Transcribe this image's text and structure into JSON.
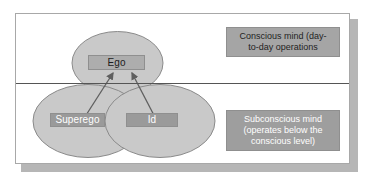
{
  "diagram": {
    "colors": {
      "card_background": "#ffffff",
      "card_border": "#a8a8a8",
      "card_shadow": "#b6b6b6",
      "ellipse_fill": "#c9c9c9",
      "ellipse_stroke": "#8a8a8a",
      "divider_line": "#555555",
      "chip_ego_fill": "#adadad",
      "chip_ego_text": "#1c1c1c",
      "chip_dark_fill": "#9a9a9a",
      "chip_dark_text": "#ffffff",
      "note_conscious_fill": "#a5a5a5",
      "note_conscious_text": "#1f1f1f",
      "note_subconscious_fill": "#9e9e9e",
      "note_subconscious_text": "#ffffff",
      "arrow_color": "#5f5f5f"
    },
    "ellipses": [
      {
        "name": "ego-ellipse",
        "label": "Ego"
      },
      {
        "name": "superego-ellipse",
        "label": "Superego"
      },
      {
        "name": "id-ellipse",
        "label": "Id"
      }
    ],
    "chips": {
      "ego": "Ego",
      "superego": "Superego",
      "id": "Id"
    },
    "notes": {
      "conscious": {
        "line1": "Conscious mind (day-",
        "line2": "to-day operations"
      },
      "subconscious": {
        "line1": "Subconscious mind",
        "line2": "(operates below the",
        "line3": "conscious level)"
      }
    },
    "arrows": [
      {
        "name": "superego-to-ego-arrow",
        "from": "Superego",
        "to": "Ego"
      },
      {
        "name": "id-to-ego-arrow",
        "from": "Id",
        "to": "Ego"
      }
    ]
  }
}
